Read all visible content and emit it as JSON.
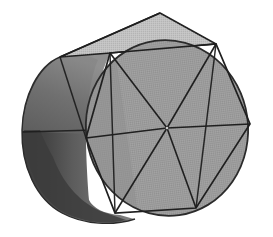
{
  "figure": {
    "title": "Cylinder with inscribed hexagonal prism",
    "view": "oblique / three-quarter view from upper left",
    "canvas": {
      "width": 273,
      "height": 237,
      "background": "#ffffff"
    }
  },
  "colors": {
    "background": "#ffffff",
    "front_face_fill": "#9b9b9b",
    "top_face_fill": "#c2c2c2",
    "barrel_light_fill": "#7a7a7a",
    "barrel_mid_fill": "#616161",
    "barrel_dark_fill": "#3c3c3c",
    "outline_stroke": "#2b2b2b",
    "edge_stroke": "#1f1f1f",
    "silhouette_stroke": "#555555"
  },
  "geometry": {
    "front_circle": {
      "label": "near circular face",
      "center_x": 167,
      "center_y": 128,
      "radius_x": 81,
      "radius_y": 88,
      "rotation_deg": -8
    },
    "back_circle": {
      "label": "far circular face (hidden)",
      "center_x": 63,
      "center_y": 122,
      "radius_x": 41,
      "radius_y": 72,
      "rotation_deg": -8
    },
    "hexagon_vertices": [
      {
        "name": "top-left",
        "x": 110,
        "y": 53
      },
      {
        "name": "top-right",
        "x": 216,
        "y": 44
      },
      {
        "name": "right",
        "x": 250,
        "y": 124
      },
      {
        "name": "bottom-right",
        "x": 196,
        "y": 208
      },
      {
        "name": "bottom-left",
        "x": 115,
        "y": 213
      },
      {
        "name": "left",
        "x": 86,
        "y": 138
      }
    ],
    "hexagon_center": {
      "x": 167,
      "y": 128
    },
    "spokes_count": 6,
    "top_face_vertices": [
      {
        "name": "back-left",
        "x": 60,
        "y": 57
      },
      {
        "name": "front-left",
        "x": 110,
        "y": 53
      },
      {
        "name": "front-right",
        "x": 216,
        "y": 44
      },
      {
        "name": "back-right",
        "x": 160,
        "y": 13
      }
    ],
    "barrel": {
      "left_extent_x": 22,
      "right_extent_x": 249,
      "top_extent_y": 13,
      "bottom_extent_y": 224
    },
    "back_top_edge": {
      "from_x": 60,
      "from_y": 57,
      "to_x": 160,
      "to_y": 13
    },
    "equator_line": {
      "from_x": 22,
      "from_y": 132,
      "to_x": 167,
      "to_y": 128
    }
  },
  "elements": {
    "front_face_name": "front circular face",
    "top_face_name": "top planar face of hexagonal prism",
    "barrel_name": "curved cylinder barrel",
    "hexagon_name": "inscribed hexagon",
    "spokes_name": "radial spokes",
    "center_name": "hexagon center point"
  }
}
